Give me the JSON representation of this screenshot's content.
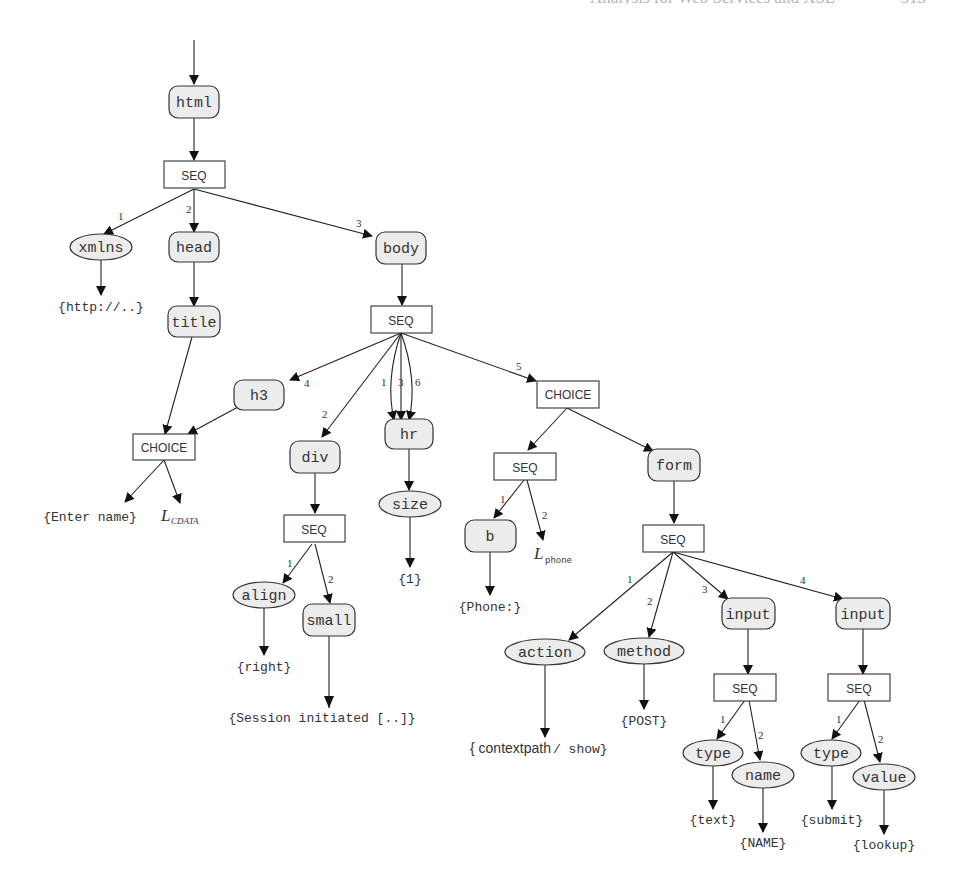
{
  "header": {
    "text": "Analysis for Web Services and XSL",
    "page_number": "315"
  },
  "diagram": {
    "type": "tree",
    "nodes": {
      "html": "html",
      "seq_root": "SEQ",
      "xmlns": "xmlns",
      "xmlns_val": "{http://..}",
      "head": "head",
      "title": "title",
      "body": "body",
      "seq_body": "SEQ",
      "h3": "h3",
      "choice_title": "CHOICE",
      "enter_name": "{Enter name}",
      "l_cdata_base": "L",
      "l_cdata_sub": "CDATA",
      "div": "div",
      "seq_div": "SEQ",
      "align": "align",
      "align_val": "{right}",
      "small": "small",
      "small_val": "{Session initiated [..]}",
      "hr": "hr",
      "size": "size",
      "size_val": "{1}",
      "choice_body": "CHOICE",
      "seq_phone": "SEQ",
      "b": "b",
      "b_val": "{Phone:}",
      "l_phone_base": "L",
      "l_phone_sub": "phone",
      "form": "form",
      "seq_form": "SEQ",
      "action": "action",
      "action_val_a": "{ contextpath",
      "action_val_b": "/ show}",
      "method": "method",
      "method_val": "{POST}",
      "input1": "input",
      "seq_input1": "SEQ",
      "type1": "type",
      "type1_val": "{text}",
      "name": "name",
      "name_val": "{NAME}",
      "input2": "input",
      "seq_input2": "SEQ",
      "type2": "type",
      "type2_val": "{submit}",
      "value": "value",
      "value_val": "{lookup}"
    },
    "edge_labels": {
      "root_1": "1",
      "root_2": "2",
      "root_3": "3",
      "body_4": "4",
      "body_2": "2",
      "body_1": "1",
      "body_3": "3",
      "body_6": "6",
      "body_5": "5",
      "div_1": "1",
      "div_2": "2",
      "phone_1": "1",
      "phone_2": "2",
      "form_1": "1",
      "form_2": "2",
      "form_3": "3",
      "form_4": "4",
      "in1_1": "1",
      "in1_2": "2",
      "in2_1": "1",
      "in2_2": "2"
    },
    "legend": {
      "rounded_box": "element",
      "ellipse": "attribute",
      "rectangle": "operator (SEQ / CHOICE)",
      "braces": "text value"
    }
  }
}
